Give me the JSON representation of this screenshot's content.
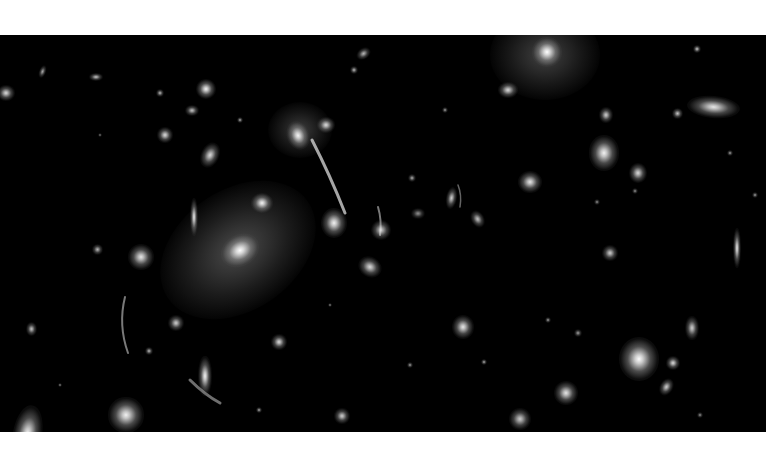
{
  "image": {
    "subject": "galaxy cluster deep field with gravitational lensing arcs",
    "palette": {
      "background": "#000000",
      "margin": "#ffffff",
      "core": "#ffffff",
      "glow": "#bdbdbd"
    },
    "field_box": {
      "x": 0,
      "y": 35,
      "width": 766,
      "height": 397
    }
  },
  "halos": [
    {
      "x": 238,
      "y": 215,
      "rx": 85,
      "ry": 60,
      "rot": -35,
      "alpha": 0.38
    },
    {
      "x": 545,
      "y": 20,
      "rx": 55,
      "ry": 45,
      "rot": 0,
      "alpha": 0.33
    },
    {
      "x": 300,
      "y": 95,
      "rx": 32,
      "ry": 28,
      "rot": 0,
      "alpha": 0.3
    }
  ],
  "galaxies": [
    {
      "x": 240,
      "y": 215,
      "rx": 18,
      "ry": 14,
      "rot": -30,
      "b": 1.0
    },
    {
      "x": 262,
      "y": 168,
      "rx": 10,
      "ry": 9,
      "rot": 0,
      "b": 0.95
    },
    {
      "x": 334,
      "y": 188,
      "rx": 12,
      "ry": 14,
      "rot": 0,
      "b": 0.95
    },
    {
      "x": 298,
      "y": 100,
      "rx": 10,
      "ry": 13,
      "rot": -20,
      "b": 0.95
    },
    {
      "x": 326,
      "y": 90,
      "rx": 8,
      "ry": 7,
      "rot": 0,
      "b": 0.85
    },
    {
      "x": 194,
      "y": 182,
      "rx": 4,
      "ry": 17,
      "rot": 0,
      "b": 0.9
    },
    {
      "x": 141,
      "y": 222,
      "rx": 12,
      "ry": 12,
      "rot": 0,
      "b": 0.9
    },
    {
      "x": 370,
      "y": 232,
      "rx": 11,
      "ry": 9,
      "rot": 30,
      "b": 0.85
    },
    {
      "x": 381,
      "y": 195,
      "rx": 9,
      "ry": 9,
      "rot": 0,
      "b": 0.8
    },
    {
      "x": 206,
      "y": 54,
      "rx": 9,
      "ry": 9,
      "rot": 0,
      "b": 0.95
    },
    {
      "x": 210,
      "y": 120,
      "rx": 8,
      "ry": 12,
      "rot": 25,
      "b": 0.85
    },
    {
      "x": 165,
      "y": 100,
      "rx": 7,
      "ry": 7,
      "rot": 0,
      "b": 0.85
    },
    {
      "x": 192,
      "y": 75,
      "rx": 6,
      "ry": 5,
      "rot": 0,
      "b": 0.75
    },
    {
      "x": 96,
      "y": 42,
      "rx": 6,
      "ry": 4,
      "rot": 0,
      "b": 0.75
    },
    {
      "x": 6,
      "y": 58,
      "rx": 8,
      "ry": 7,
      "rot": 0,
      "b": 0.85
    },
    {
      "x": 42,
      "y": 37,
      "rx": 3,
      "ry": 6,
      "rot": 20,
      "b": 0.65
    },
    {
      "x": 364,
      "y": 18,
      "rx": 7,
      "ry": 5,
      "rot": -35,
      "b": 0.7
    },
    {
      "x": 354,
      "y": 35,
      "rx": 4,
      "ry": 4,
      "rot": 0,
      "b": 0.7
    },
    {
      "x": 547,
      "y": 17,
      "rx": 14,
      "ry": 14,
      "rot": 0,
      "b": 1.0
    },
    {
      "x": 508,
      "y": 55,
      "rx": 9,
      "ry": 7,
      "rot": 0,
      "b": 0.85
    },
    {
      "x": 604,
      "y": 118,
      "rx": 14,
      "ry": 16,
      "rot": 0,
      "b": 0.95
    },
    {
      "x": 606,
      "y": 80,
      "rx": 6,
      "ry": 7,
      "rot": 0,
      "b": 0.8
    },
    {
      "x": 638,
      "y": 138,
      "rx": 8,
      "ry": 9,
      "rot": 0,
      "b": 0.85
    },
    {
      "x": 530,
      "y": 147,
      "rx": 11,
      "ry": 10,
      "rot": 0,
      "b": 0.9
    },
    {
      "x": 713,
      "y": 72,
      "rx": 24,
      "ry": 10,
      "rot": 5,
      "b": 0.9
    },
    {
      "x": 677,
      "y": 78,
      "rx": 5,
      "ry": 5,
      "rot": 0,
      "b": 0.75
    },
    {
      "x": 697,
      "y": 14,
      "rx": 4,
      "ry": 4,
      "rot": 0,
      "b": 0.75
    },
    {
      "x": 451,
      "y": 163,
      "rx": 5,
      "ry": 10,
      "rot": 10,
      "b": 0.8
    },
    {
      "x": 478,
      "y": 184,
      "rx": 6,
      "ry": 8,
      "rot": -30,
      "b": 0.75
    },
    {
      "x": 737,
      "y": 213,
      "rx": 4,
      "ry": 18,
      "rot": 0,
      "b": 0.9
    },
    {
      "x": 610,
      "y": 218,
      "rx": 7,
      "ry": 7,
      "rot": 0,
      "b": 0.8
    },
    {
      "x": 463,
      "y": 292,
      "rx": 10,
      "ry": 11,
      "rot": 0,
      "b": 0.9
    },
    {
      "x": 639,
      "y": 324,
      "rx": 18,
      "ry": 20,
      "rot": 0,
      "b": 1.0
    },
    {
      "x": 673,
      "y": 328,
      "rx": 6,
      "ry": 6,
      "rot": 0,
      "b": 0.85
    },
    {
      "x": 667,
      "y": 352,
      "rx": 6,
      "ry": 8,
      "rot": 30,
      "b": 0.8
    },
    {
      "x": 692,
      "y": 293,
      "rx": 6,
      "ry": 11,
      "rot": 0,
      "b": 0.8
    },
    {
      "x": 566,
      "y": 358,
      "rx": 11,
      "ry": 11,
      "rot": 0,
      "b": 0.9
    },
    {
      "x": 520,
      "y": 384,
      "rx": 10,
      "ry": 10,
      "rot": 0,
      "b": 0.8
    },
    {
      "x": 27,
      "y": 399,
      "rx": 13,
      "ry": 26,
      "rot": 10,
      "b": 0.95
    },
    {
      "x": 126,
      "y": 380,
      "rx": 16,
      "ry": 16,
      "rot": 0,
      "b": 0.95
    },
    {
      "x": 205,
      "y": 341,
      "rx": 6,
      "ry": 18,
      "rot": 0,
      "b": 0.95
    },
    {
      "x": 176,
      "y": 288,
      "rx": 7,
      "ry": 7,
      "rot": 0,
      "b": 0.8
    },
    {
      "x": 279,
      "y": 307,
      "rx": 7,
      "ry": 7,
      "rot": 0,
      "b": 0.85
    },
    {
      "x": 342,
      "y": 381,
      "rx": 7,
      "ry": 7,
      "rot": 0,
      "b": 0.8
    },
    {
      "x": 31,
      "y": 294,
      "rx": 5,
      "ry": 6,
      "rot": 0,
      "b": 0.75
    },
    {
      "x": 149,
      "y": 316,
      "rx": 4,
      "ry": 4,
      "rot": 0,
      "b": 0.7
    },
    {
      "x": 97,
      "y": 214,
      "rx": 5,
      "ry": 5,
      "rot": 0,
      "b": 0.7
    },
    {
      "x": 160,
      "y": 58,
      "rx": 4,
      "ry": 4,
      "rot": 0,
      "b": 0.7
    },
    {
      "x": 240,
      "y": 85,
      "rx": 3,
      "ry": 3,
      "rot": 0,
      "b": 0.65
    },
    {
      "x": 259,
      "y": 375,
      "rx": 3,
      "ry": 3,
      "rot": 0,
      "b": 0.65
    },
    {
      "x": 484,
      "y": 327,
      "rx": 3,
      "ry": 3,
      "rot": 0,
      "b": 0.65
    },
    {
      "x": 548,
      "y": 285,
      "rx": 3,
      "ry": 3,
      "rot": 0,
      "b": 0.6
    },
    {
      "x": 730,
      "y": 118,
      "rx": 3,
      "ry": 3,
      "rot": 0,
      "b": 0.6
    },
    {
      "x": 755,
      "y": 160,
      "rx": 3,
      "ry": 3,
      "rot": 0,
      "b": 0.6
    },
    {
      "x": 410,
      "y": 330,
      "rx": 3,
      "ry": 3,
      "rot": 0,
      "b": 0.6
    },
    {
      "x": 445,
      "y": 75,
      "rx": 3,
      "ry": 3,
      "rot": 0,
      "b": 0.6
    },
    {
      "x": 578,
      "y": 298,
      "rx": 4,
      "ry": 4,
      "rot": 0,
      "b": 0.6
    },
    {
      "x": 412,
      "y": 143,
      "rx": 4,
      "ry": 4,
      "rot": 0,
      "b": 0.65
    },
    {
      "x": 418,
      "y": 178,
      "rx": 6,
      "ry": 5,
      "rot": 0,
      "b": 0.55
    },
    {
      "x": 597,
      "y": 167,
      "rx": 3,
      "ry": 3,
      "rot": 0,
      "b": 0.55
    },
    {
      "x": 635,
      "y": 156,
      "rx": 3,
      "ry": 3,
      "rot": 0,
      "b": 0.55
    },
    {
      "x": 700,
      "y": 380,
      "rx": 3,
      "ry": 3,
      "rot": 0,
      "b": 0.55
    },
    {
      "x": 60,
      "y": 350,
      "rx": 2,
      "ry": 2,
      "rot": 0,
      "b": 0.55
    },
    {
      "x": 330,
      "y": 270,
      "rx": 2,
      "ry": 2,
      "rot": 0,
      "b": 0.55
    },
    {
      "x": 100,
      "y": 100,
      "rx": 2,
      "ry": 2,
      "rot": 0,
      "b": 0.5
    }
  ],
  "arcs": [
    {
      "d": "M 312 105 Q 330 140 345 178",
      "w": 3,
      "alpha": 0.75
    },
    {
      "d": "M 125 262 Q 118 290 128 318",
      "w": 2,
      "alpha": 0.55
    },
    {
      "d": "M 190 345 Q 205 360 220 368",
      "w": 3,
      "alpha": 0.5
    },
    {
      "d": "M 378 172 Q 382 185 380 200",
      "w": 2,
      "alpha": 0.55
    },
    {
      "d": "M 458 150 Q 462 160 460 172",
      "w": 1.5,
      "alpha": 0.45
    }
  ]
}
